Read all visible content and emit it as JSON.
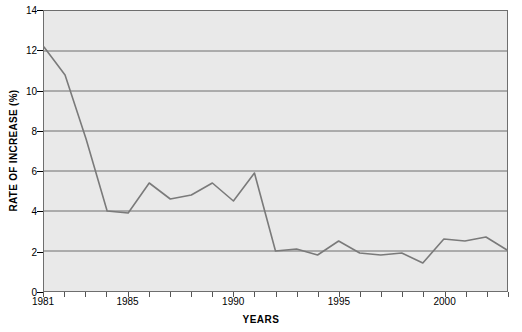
{
  "chart_data": {
    "type": "line",
    "title": "",
    "xlabel": "YEARS",
    "ylabel": "RATE OF INCREASE (%)",
    "xlim": [
      1981,
      2003
    ],
    "ylim": [
      0,
      14
    ],
    "grid": true,
    "legend": false,
    "yticks": [
      0,
      2,
      4,
      6,
      8,
      10,
      12,
      14
    ],
    "ytick_labels": [
      "0",
      "2",
      "4",
      "6",
      "8",
      "10",
      "12",
      "14"
    ],
    "xticks": [
      1981,
      1985,
      1990,
      1995,
      2000
    ],
    "xtick_labels": [
      "1981",
      "1985",
      "1990",
      "1995",
      "2000"
    ],
    "xminor_step": 1,
    "line_color": "#7a7a7a",
    "plot_bg": "#e9e9e9",
    "grid_color": "#6e6e6e",
    "x": [
      1981,
      1982,
      1983,
      1984,
      1985,
      1986,
      1987,
      1988,
      1989,
      1990,
      1991,
      1992,
      1993,
      1994,
      1995,
      1996,
      1997,
      1998,
      1999,
      2000,
      2001,
      2002,
      2003
    ],
    "values": [
      12.2,
      10.8,
      7.6,
      4.0,
      3.9,
      5.4,
      4.6,
      4.8,
      5.4,
      4.5,
      5.9,
      2.0,
      2.1,
      1.8,
      2.5,
      1.9,
      1.8,
      1.9,
      1.4,
      2.6,
      2.5,
      2.7,
      2.05
    ],
    "series": [
      {
        "name": "Rate of increase",
        "values": [
          12.2,
          10.8,
          7.6,
          4.0,
          3.9,
          5.4,
          4.6,
          4.8,
          5.4,
          4.5,
          5.9,
          2.0,
          2.1,
          1.8,
          2.5,
          1.9,
          1.8,
          1.9,
          1.4,
          2.6,
          2.5,
          2.7,
          2.05
        ]
      }
    ]
  }
}
